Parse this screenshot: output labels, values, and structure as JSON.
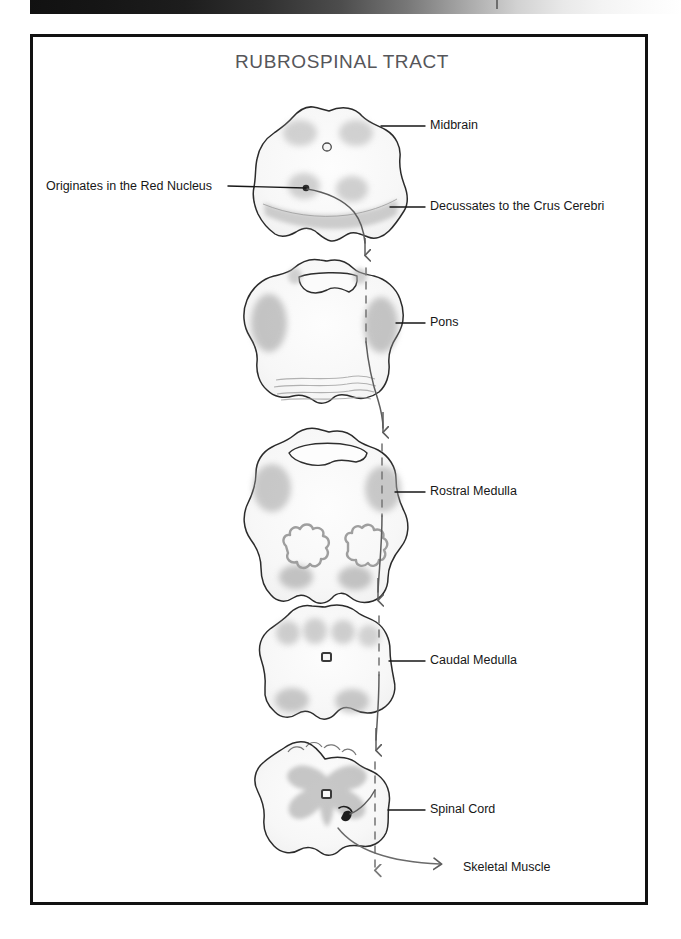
{
  "page": {
    "title": "RUBROSPINAL TRACT",
    "title_color": "#56565a",
    "frame_color": "#111111",
    "background": "#ffffff"
  },
  "top_strip": {
    "name": "scan-gradient-bar",
    "gradient_from": "#111111",
    "gradient_to": "#ffffff"
  },
  "labels": {
    "midbrain": "Midbrain",
    "red_nucleus": "Originates in the Red Nucleus",
    "crus_cerebri": "Decussates to the Crus Cerebri",
    "pons": "Pons",
    "rostral_medulla": "Rostral Medulla",
    "caudal_medulla": "Caudal Medulla",
    "spinal_cord": "Spinal Cord",
    "skeletal_muscle": "Skeletal Muscle"
  },
  "diagram": {
    "type": "anatomical-pathway-illustration",
    "style": "hand-drawn pencil sketch",
    "sections": [
      {
        "id": "midbrain",
        "label": "Midbrain",
        "order": 1,
        "features": [
          "superior colliculi",
          "cerebral aqueduct",
          "red nuclei",
          "crus cerebri"
        ]
      },
      {
        "id": "pons",
        "label": "Pons",
        "order": 2,
        "features": [
          "fourth ventricle",
          "middle cerebellar peduncles",
          "transverse pontine fibers"
        ]
      },
      {
        "id": "rostral-medulla",
        "label": "Rostral Medulla",
        "order": 3,
        "features": [
          "fourth ventricle",
          "inferior olivary nuclei",
          "pyramids"
        ]
      },
      {
        "id": "caudal-medulla",
        "label": "Caudal Medulla",
        "order": 4,
        "features": [
          "central canal",
          "dorsal column nuclei",
          "pyramids"
        ]
      },
      {
        "id": "spinal-cord",
        "label": "Spinal Cord",
        "order": 5,
        "features": [
          "central canal",
          "gray matter butterfly",
          "ventral horn synapse"
        ]
      }
    ],
    "tract": {
      "name": "rubrospinal tract",
      "origin": "Red Nucleus",
      "decussation": "Crus Cerebri",
      "termination": "Skeletal Muscle",
      "line_style_outside_section": "solid",
      "line_style_inside_section": "dashed",
      "line_color": "#5d5d5d"
    }
  }
}
